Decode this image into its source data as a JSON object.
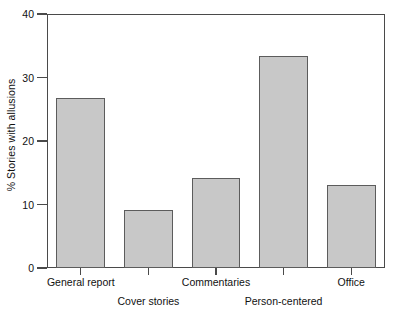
{
  "chart_data": {
    "type": "bar",
    "title": "",
    "xlabel": "",
    "ylabel": "% Stories with allusions",
    "ylim": [
      0,
      40
    ],
    "yticks": [
      0,
      10,
      20,
      30,
      40
    ],
    "grid": false,
    "legend": null,
    "categories": [
      "General report",
      "Cover stories",
      "Commentaries",
      "Person-centered",
      "Office"
    ],
    "values": [
      26.8,
      9.1,
      14.2,
      33.4,
      13.1
    ],
    "bar_fill_color": "#c8c8c8",
    "bar_edge_color": "#5c5c5c",
    "axis_color": "#4a4a4a",
    "background_color": "#ffffff",
    "label_rows": [
      1,
      2,
      1,
      2,
      1
    ]
  }
}
